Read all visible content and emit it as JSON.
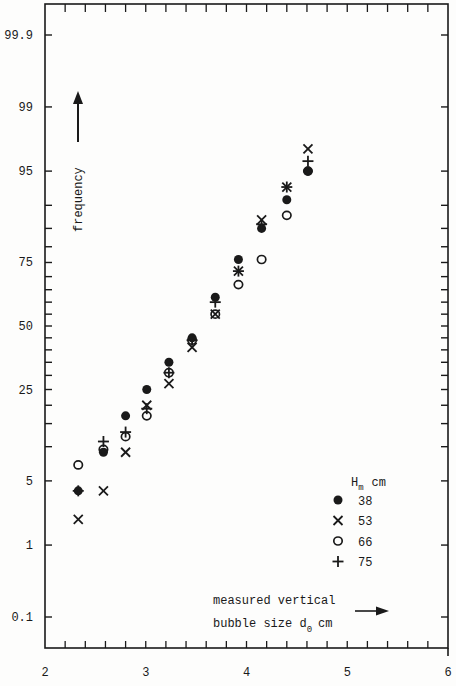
{
  "chart_data": {
    "type": "scatter",
    "title": "",
    "xlabel": "measured vertical bubble size d0 cm",
    "xlabel_line1": "measured vertical",
    "xlabel_line2": "bubble size d",
    "xlabel_sub": "0",
    "xlabel_unit": "cm",
    "ylabel": "frequency",
    "y_scale": "probability (normal cumulative)",
    "xlim": [
      2,
      6
    ],
    "x_ticks": [
      2,
      3,
      4,
      5,
      6
    ],
    "x_tick_labels": [
      "2",
      "3",
      "4",
      "5",
      "6"
    ],
    "y_ticks": [
      0.1,
      1,
      5,
      25,
      50,
      75,
      95,
      99,
      99.9
    ],
    "y_tick_labels": [
      "0.1",
      "1",
      "5",
      "25",
      "50",
      "75",
      "95",
      "99",
      "99.9"
    ],
    "grid": false,
    "legend_title": "H",
    "legend_title_sub": "m",
    "legend_title_unit": "cm",
    "legend_position": "lower right",
    "series": [
      {
        "name": "38",
        "marker": "filled-circle",
        "x": [
          2.33,
          2.58,
          2.8,
          3.01,
          3.23,
          3.46,
          3.69,
          3.92,
          4.15,
          4.4,
          4.61
        ],
        "y": [
          4,
          9,
          17,
          25,
          35,
          45,
          62,
          76,
          85,
          91,
          95
        ]
      },
      {
        "name": "53",
        "marker": "x-cross",
        "x": [
          2.33,
          2.58,
          2.8,
          3.01,
          3.23,
          3.46,
          3.69,
          3.92,
          4.15,
          4.4,
          4.61
        ],
        "y": [
          2,
          4,
          9,
          20,
          27,
          41,
          55,
          72,
          87,
          93,
          97
        ]
      },
      {
        "name": "66",
        "marker": "open-circle",
        "x": [
          2.33,
          2.58,
          2.8,
          3.01,
          3.23,
          3.46,
          3.69,
          3.92,
          4.15,
          4.4,
          4.61
        ],
        "y": [
          7,
          9.5,
          12,
          17,
          31,
          44,
          55,
          67,
          76,
          88,
          95
        ]
      },
      {
        "name": "75",
        "marker": "plus",
        "x": [
          2.33,
          2.58,
          2.8,
          3.01,
          3.23,
          3.46,
          3.69,
          3.92,
          4.15,
          4.4,
          4.61
        ],
        "y": [
          4,
          11,
          13,
          19,
          31,
          44,
          60,
          72,
          86,
          93,
          96
        ]
      }
    ]
  },
  "axes": {
    "ylabel": "frequency",
    "xlabel_line1": "measured vertical",
    "xlabel_line2": "bubble size d",
    "xlabel_sub": "0",
    "xlabel_unit": "cm"
  },
  "legend": {
    "title": "H",
    "title_sub": "m",
    "title_unit": "cm",
    "items": [
      {
        "label": "38",
        "marker": "filled-circle"
      },
      {
        "label": "53",
        "marker": "x-cross"
      },
      {
        "label": "66",
        "marker": "open-circle"
      },
      {
        "label": "75",
        "marker": "plus"
      }
    ]
  }
}
